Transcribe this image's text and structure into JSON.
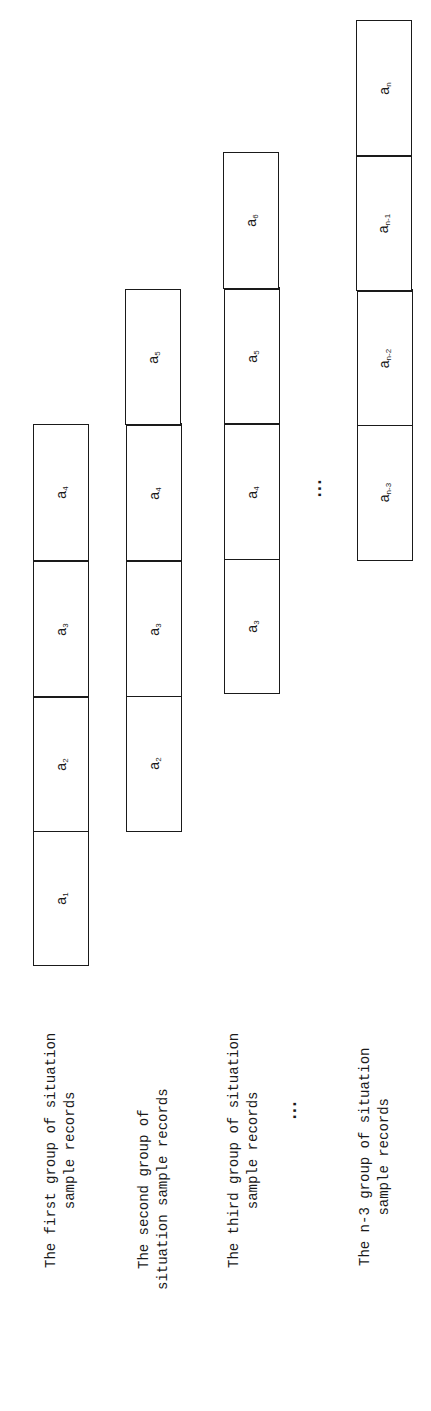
{
  "diagram": {
    "orientation": "rotated -90deg",
    "groups": [
      {
        "label_line1": "The first group of situation",
        "label_line2": "sample records",
        "cells": [
          {
            "base": "a",
            "sub": "1"
          },
          {
            "base": "a",
            "sub": "2"
          },
          {
            "base": "a",
            "sub": "3"
          },
          {
            "base": "a",
            "sub": "4"
          }
        ]
      },
      {
        "label_line1": "The second group of",
        "label_line2": "situation sample records",
        "cells": [
          {
            "base": "a",
            "sub": "2"
          },
          {
            "base": "a",
            "sub": "3"
          },
          {
            "base": "a",
            "sub": "4"
          },
          {
            "base": "a",
            "sub": "5"
          }
        ]
      },
      {
        "label_line1": "The third group of situation",
        "label_line2": "sample records",
        "cells": [
          {
            "base": "a",
            "sub": "3"
          },
          {
            "base": "a",
            "sub": "4"
          },
          {
            "base": "a",
            "sub": "5"
          },
          {
            "base": "a",
            "sub": "6"
          }
        ]
      },
      {
        "label_line1": "The n-3 group of situation",
        "label_line2": "sample records",
        "cells": [
          {
            "base": "a",
            "sub": "n-3"
          },
          {
            "base": "a",
            "sub": "n-2"
          },
          {
            "base": "a",
            "sub": "n-1"
          },
          {
            "base": "a",
            "sub": "n"
          }
        ]
      }
    ],
    "ellipsis_label": "...",
    "ellipsis_cells": "..."
  }
}
